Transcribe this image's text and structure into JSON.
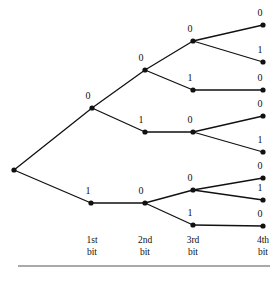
{
  "figure": {
    "background_color": "#ffffff",
    "line_color": "#111111",
    "rule_color": "#555555",
    "width": 278,
    "height": 281
  },
  "chart_data": {
    "type": "diagram",
    "subtype": "binary-tree",
    "title": "",
    "xlabel": "",
    "ylabel": "",
    "levels": [
      "1st bit",
      "2nd bit",
      "3rd bit",
      "4th bit"
    ],
    "level_x": [
      92,
      145,
      193,
      263
    ],
    "nodes": [
      {
        "id": "root",
        "label": "",
        "x": 14,
        "y": 170,
        "level": 0,
        "show_label": false
      },
      {
        "id": "n0",
        "label": "0",
        "x": 92,
        "y": 108,
        "level": 1,
        "label_x": 88,
        "label_y": 99
      },
      {
        "id": "n1",
        "label": "1",
        "x": 91,
        "y": 203,
        "level": 1,
        "label_x": 88,
        "label_y": 194
      },
      {
        "id": "n00",
        "label": "0",
        "x": 145,
        "y": 70,
        "level": 2,
        "label_x": 141,
        "label_y": 61
      },
      {
        "id": "n01",
        "label": "1",
        "x": 145,
        "y": 132,
        "level": 2,
        "label_x": 141,
        "label_y": 123
      },
      {
        "id": "n10",
        "label": "0",
        "x": 145,
        "y": 203,
        "level": 2,
        "label_x": 141,
        "label_y": 194
      },
      {
        "id": "n000",
        "label": "0",
        "x": 193,
        "y": 41,
        "level": 3,
        "label_x": 190,
        "label_y": 32
      },
      {
        "id": "n001",
        "label": "1",
        "x": 193,
        "y": 90,
        "level": 3,
        "label_x": 190,
        "label_y": 81
      },
      {
        "id": "n010",
        "label": "0",
        "x": 193,
        "y": 132,
        "level": 3,
        "label_x": 190,
        "label_y": 123
      },
      {
        "id": "n100",
        "label": "0",
        "x": 193,
        "y": 190,
        "level": 3,
        "label_x": 190,
        "label_y": 181
      },
      {
        "id": "n101",
        "label": "1",
        "x": 193,
        "y": 225,
        "level": 3,
        "label_x": 190,
        "label_y": 216
      },
      {
        "id": "n0000",
        "label": "0",
        "x": 263,
        "y": 25,
        "level": 4,
        "label_x": 260,
        "label_y": 16
      },
      {
        "id": "n0001",
        "label": "1",
        "x": 263,
        "y": 62,
        "level": 4,
        "label_x": 260,
        "label_y": 53
      },
      {
        "id": "n0010",
        "label": "0",
        "x": 263,
        "y": 90,
        "level": 4,
        "label_x": 260,
        "label_y": 81
      },
      {
        "id": "n0100",
        "label": "0",
        "x": 263,
        "y": 116,
        "level": 4,
        "label_x": 260,
        "label_y": 107
      },
      {
        "id": "n0101",
        "label": "1",
        "x": 263,
        "y": 152,
        "level": 4,
        "label_x": 260,
        "label_y": 143
      },
      {
        "id": "n1000",
        "label": "0",
        "x": 263,
        "y": 178,
        "level": 4,
        "label_x": 260,
        "label_y": 169
      },
      {
        "id": "n1001",
        "label": "1",
        "x": 263,
        "y": 200,
        "level": 4,
        "label_x": 260,
        "label_y": 191
      },
      {
        "id": "n1010",
        "label": "0",
        "x": 263,
        "y": 226,
        "level": 4,
        "label_x": 260,
        "label_y": 217
      }
    ],
    "edges": [
      {
        "from": "root",
        "to": "n0"
      },
      {
        "from": "root",
        "to": "n1"
      },
      {
        "from": "n0",
        "to": "n00"
      },
      {
        "from": "n0",
        "to": "n01"
      },
      {
        "from": "n1",
        "to": "n10"
      },
      {
        "from": "n00",
        "to": "n000"
      },
      {
        "from": "n00",
        "to": "n001"
      },
      {
        "from": "n01",
        "to": "n010"
      },
      {
        "from": "n10",
        "to": "n100"
      },
      {
        "from": "n10",
        "to": "n101"
      },
      {
        "from": "n000",
        "to": "n0000"
      },
      {
        "from": "n000",
        "to": "n0001"
      },
      {
        "from": "n001",
        "to": "n0010"
      },
      {
        "from": "n010",
        "to": "n0100"
      },
      {
        "from": "n010",
        "to": "n0101"
      },
      {
        "from": "n100",
        "to": "n1000"
      },
      {
        "from": "n100",
        "to": "n1001"
      },
      {
        "from": "n101",
        "to": "n1010"
      }
    ]
  },
  "axis": {
    "labels": [
      {
        "line1": "1st",
        "line2": "bit",
        "x": 92
      },
      {
        "line1": "2nd",
        "line2": "bit",
        "x": 145
      },
      {
        "line1": "3rd",
        "line2": "bit",
        "x": 193
      },
      {
        "line1": "4th",
        "line2": "bit",
        "x": 263
      }
    ],
    "line1_y": 243,
    "line2_y": 255,
    "rule": {
      "x1": 18,
      "x2": 270,
      "y": 266
    }
  }
}
